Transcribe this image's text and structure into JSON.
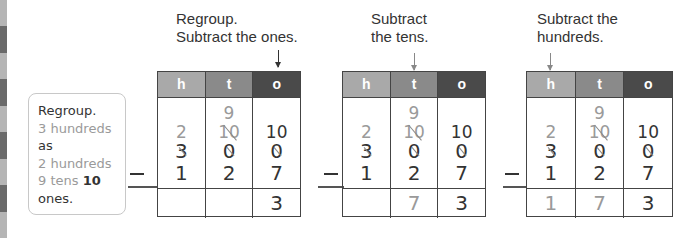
{
  "note": {
    "lines": [
      {
        "text": "Regroup.",
        "style": "dark"
      },
      {
        "text": "3 hundreds",
        "style": "gray"
      },
      {
        "text": "as",
        "style": "dark"
      },
      {
        "text": "2 hundreds",
        "style": "gray"
      },
      {
        "text_a": "9 tens ",
        "text_b": "10",
        "style": "mixed"
      },
      {
        "text": "ones.",
        "style": "dark"
      }
    ]
  },
  "steps": [
    {
      "caption_line1": "Regroup.",
      "caption_line2": "Subtract the ones.",
      "arrow_column": "o",
      "headers": [
        "h",
        "t",
        "o"
      ],
      "regroup_top": {
        "h": "",
        "t": "9",
        "o": ""
      },
      "regroup_mid": {
        "h": "2",
        "t": "10",
        "o": "10"
      },
      "minuend": {
        "h": "3",
        "t": "0",
        "o": "0"
      },
      "subtrahend": {
        "h": "1",
        "t": "2",
        "o": "7"
      },
      "minus_sign": "—",
      "result": {
        "h": "",
        "t": "",
        "o": "3"
      }
    },
    {
      "caption_line1": "Subtract",
      "caption_line2": "the tens.",
      "arrow_column": "t",
      "headers": [
        "h",
        "t",
        "o"
      ],
      "regroup_top": {
        "h": "",
        "t": "9",
        "o": ""
      },
      "regroup_mid": {
        "h": "2",
        "t": "10",
        "o": "10"
      },
      "minuend": {
        "h": "3",
        "t": "0",
        "o": "0"
      },
      "subtrahend": {
        "h": "1",
        "t": "2",
        "o": "7"
      },
      "minus_sign": "—",
      "result": {
        "h": "",
        "t": "7",
        "o": "3"
      }
    },
    {
      "caption_line1": "Subtract the",
      "caption_line2": "hundreds.",
      "arrow_column": "h",
      "headers": [
        "h",
        "t",
        "o"
      ],
      "regroup_top": {
        "h": "",
        "t": "9",
        "o": ""
      },
      "regroup_mid": {
        "h": "2",
        "t": "10",
        "o": "10"
      },
      "minuend": {
        "h": "3",
        "t": "0",
        "o": "0"
      },
      "subtrahend": {
        "h": "1",
        "t": "2",
        "o": "7"
      },
      "minus_sign": "—",
      "result": {
        "h": "1",
        "t": "7",
        "o": "3"
      }
    }
  ],
  "colors": {
    "header_h": "#a9a9a9",
    "header_t": "#8a8a8a",
    "header_o": "#4a4a4a",
    "regroup_text": "#9a9a9a",
    "main_text": "#333333"
  }
}
